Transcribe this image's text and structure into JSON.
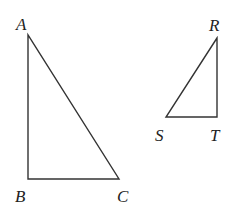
{
  "diagram": {
    "triangles": [
      {
        "name": "ABC",
        "vertices": [
          {
            "label": "A",
            "x": 28,
            "y": 35
          },
          {
            "label": "B",
            "x": 28,
            "y": 179
          },
          {
            "label": "C",
            "x": 119,
            "y": 179
          }
        ]
      },
      {
        "name": "RST",
        "vertices": [
          {
            "label": "R",
            "x": 217,
            "y": 38
          },
          {
            "label": "S",
            "x": 166,
            "y": 117
          },
          {
            "label": "T",
            "x": 217,
            "y": 117
          }
        ]
      }
    ]
  }
}
